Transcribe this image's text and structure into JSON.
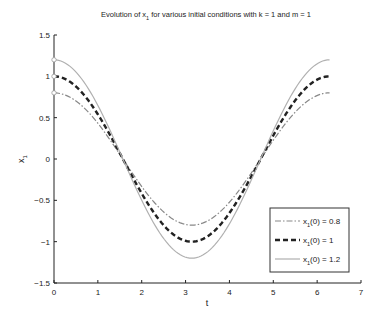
{
  "chart_data": {
    "type": "line",
    "title_parts": {
      "pre": "Evolution of x",
      "sub": "1",
      "post": " for various initial conditions with k = 1 and m = 1"
    },
    "xlabel": "t",
    "ylabel": "x_1",
    "ylabel_parts": {
      "main": "x",
      "sub": "1"
    },
    "xlim": [
      0,
      7
    ],
    "ylim": [
      -1.5,
      1.5
    ],
    "xticks": [
      "0",
      "1",
      "2",
      "3",
      "4",
      "5",
      "6",
      "7"
    ],
    "yticks": [
      "-1.5",
      "-1",
      "-0.5",
      "0",
      "0.5",
      "1",
      "1.5"
    ],
    "grid": false,
    "legend_position": "lower right",
    "x_range": [
      0,
      6.2832
    ],
    "function": "x1(t) = x1(0) * cos(t)",
    "series": [
      {
        "name": "x1(0) = 0.8",
        "label_pre": "x",
        "label_sub": "1",
        "label_post": "(0) = 0.8",
        "amplitude": 0.8,
        "style": "dash-dot",
        "color": "#888888",
        "x": [
          0,
          0.785,
          1.571,
          2.356,
          3.142,
          3.927,
          4.712,
          5.498,
          6.283
        ],
        "values": [
          0.8,
          0.566,
          0,
          -0.566,
          -0.8,
          -0.566,
          0,
          0.566,
          0.8
        ]
      },
      {
        "name": "x1(0) = 1",
        "label_pre": "x",
        "label_sub": "1",
        "label_post": "(0) = 1",
        "amplitude": 1.0,
        "style": "dashed",
        "color": "#222222",
        "x": [
          0,
          0.785,
          1.571,
          2.356,
          3.142,
          3.927,
          4.712,
          5.498,
          6.283
        ],
        "values": [
          1.0,
          0.707,
          0,
          -0.707,
          -1.0,
          -0.707,
          0,
          0.707,
          1.0
        ]
      },
      {
        "name": "x1(0) = 1.2",
        "label_pre": "x",
        "label_sub": "1",
        "label_post": "(0) = 1.2",
        "amplitude": 1.2,
        "style": "solid",
        "color": "#b0b0b0",
        "x": [
          0,
          0.785,
          1.571,
          2.356,
          3.142,
          3.927,
          4.712,
          5.498,
          6.283
        ],
        "values": [
          1.2,
          0.849,
          0,
          -0.849,
          -1.2,
          -0.849,
          0,
          0.849,
          1.2
        ]
      }
    ]
  }
}
